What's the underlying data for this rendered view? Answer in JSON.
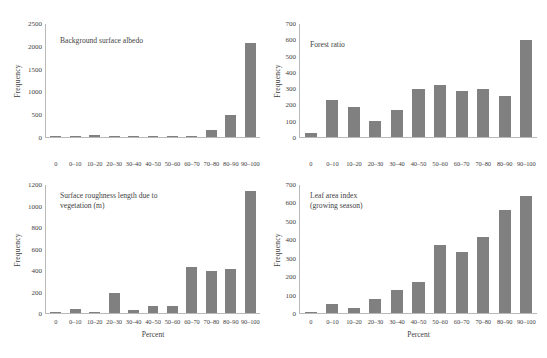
{
  "figure": {
    "bar_color": "#808080",
    "axis_color": "#b9b9b9",
    "text_color": "#3f3f3f",
    "background": "#ffffff"
  },
  "chart_data": [
    {
      "type": "bar",
      "title": "Background surface albedo",
      "xlabel": "",
      "ylabel": "Frequency",
      "categories": [
        "0",
        "0–10",
        "10–20",
        "20–30",
        "30–40",
        "40–50",
        "50–60",
        "60–70",
        "70–80",
        "80–90",
        "90–100"
      ],
      "values": [
        2,
        18,
        38,
        8,
        9,
        1,
        1,
        22,
        150,
        490,
        2080
      ],
      "ylim": [
        0,
        2500
      ],
      "yticks": [
        0,
        500,
        1000,
        1500,
        2000,
        2500
      ],
      "grid": false,
      "legend": "none"
    },
    {
      "type": "bar",
      "title": "Forest ratio",
      "xlabel": "",
      "ylabel": "Frequency",
      "categories": [
        "0",
        "0–10",
        "10–20",
        "20–30",
        "30–40",
        "40–50",
        "50–60",
        "60–70",
        "70–80",
        "80–90",
        "90–100"
      ],
      "values": [
        25,
        230,
        185,
        100,
        168,
        300,
        325,
        288,
        295,
        253,
        600
      ],
      "ylim": [
        0,
        700
      ],
      "yticks": [
        0,
        100,
        200,
        300,
        400,
        500,
        600,
        700
      ],
      "grid": false,
      "legend": "none"
    },
    {
      "type": "bar",
      "title": "Surface roughness length due to\nvegetation (m)",
      "xlabel": "Percent",
      "ylabel": "Frequency",
      "categories": [
        "0",
        "0–10",
        "10–20",
        "20–30",
        "30–40",
        "40–50",
        "50–60",
        "60–70",
        "70–80",
        "80–90",
        "90–100"
      ],
      "values": [
        3,
        38,
        10,
        185,
        28,
        62,
        65,
        435,
        395,
        412,
        1145
      ],
      "ylim": [
        0,
        1200
      ],
      "yticks": [
        0,
        200,
        400,
        600,
        800,
        1000,
        1200
      ],
      "grid": false,
      "legend": "none"
    },
    {
      "type": "bar",
      "title": "Leaf area index\n(growing season)",
      "xlabel": "Percent",
      "ylabel": "Frequency",
      "categories": [
        "0",
        "0–10",
        "10–20",
        "20–30",
        "30–40",
        "40–50",
        "50–60",
        "60–70",
        "70–80",
        "80–90",
        "90–100"
      ],
      "values": [
        5,
        52,
        30,
        78,
        128,
        168,
        370,
        335,
        415,
        565,
        638
      ],
      "ylim": [
        0,
        700
      ],
      "yticks": [
        0,
        100,
        200,
        300,
        400,
        500,
        600,
        700
      ],
      "grid": false,
      "legend": "none"
    }
  ],
  "panels": [
    {
      "title_left": 60,
      "title_top": 36,
      "plot_left": 46,
      "plot_right": 14,
      "plot_top": 24,
      "plot_bottom": 41,
      "ytick_left": 14,
      "xtick_top": 160,
      "xaxis_title_top": 0
    },
    {
      "title_left": 36,
      "title_top": 40,
      "plot_left": 26,
      "plot_right": 10,
      "plot_top": 24,
      "plot_bottom": 41,
      "ytick_left": 0,
      "xtick_top": 160,
      "xaxis_title_top": 0
    },
    {
      "title_left": 60,
      "title_top": 12,
      "plot_left": 46,
      "plot_right": 14,
      "plot_top": 6,
      "plot_bottom": 44,
      "ytick_left": 14,
      "xtick_top": 139,
      "xaxis_title_top": 151
    },
    {
      "title_left": 36,
      "title_top": 12,
      "plot_left": 26,
      "plot_right": 10,
      "plot_top": 6,
      "plot_bottom": 44,
      "ytick_left": 0,
      "xtick_top": 139,
      "xaxis_title_top": 151
    }
  ]
}
